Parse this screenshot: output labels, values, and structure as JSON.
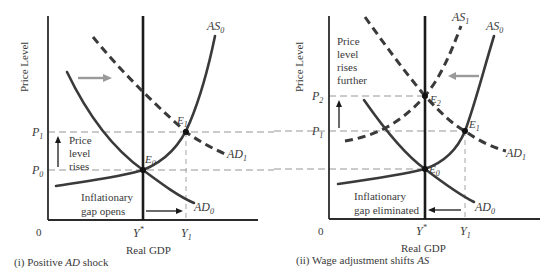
{
  "panels": [
    {
      "id": "i",
      "caption_prefix": "(i) Positive ",
      "caption_italic": "AD",
      "caption_suffix": " shock",
      "y_axis_label": "Price Level",
      "x_axis_label": "Real GDP",
      "origin_label": "0",
      "x_ticks": {
        "potential": "Y",
        "potential_sup": "*",
        "y1": "Y",
        "y1_sub": "1"
      },
      "y_ticks": [
        {
          "label": "P",
          "sub": "1"
        },
        {
          "label": "P",
          "sub": "0"
        }
      ],
      "curves": [
        {
          "label": "AS",
          "sub": "0",
          "style": "solid"
        },
        {
          "label": "AD",
          "sub": "0",
          "style": "solid"
        },
        {
          "label": "AD",
          "sub": "1",
          "style": "dashed"
        }
      ],
      "points": [
        {
          "label": "E",
          "sub": "0"
        },
        {
          "label": "E",
          "sub": "1"
        }
      ],
      "annotations": {
        "price_note": [
          "Price",
          "level",
          "rises"
        ],
        "gap_note": [
          "Inflationary",
          "gap opens"
        ]
      }
    },
    {
      "id": "ii",
      "caption_prefix": "(ii) Wage adjustment shifts ",
      "caption_italic": "AS",
      "caption_suffix": "",
      "y_axis_label": "Price Level",
      "x_axis_label": "Real GDP",
      "origin_label": "0",
      "x_ticks": {
        "potential": "Y",
        "potential_sup": "*",
        "y1": "Y",
        "y1_sub": "1"
      },
      "y_ticks": [
        {
          "label": "P",
          "sub": "2"
        },
        {
          "label": "P",
          "sub": "1"
        }
      ],
      "curves": [
        {
          "label": "AS",
          "sub": "0",
          "style": "solid"
        },
        {
          "label": "AS",
          "sub": "1",
          "style": "dashed"
        },
        {
          "label": "AD",
          "sub": "0",
          "style": "solid"
        },
        {
          "label": "AD",
          "sub": "1",
          "style": "dashed"
        }
      ],
      "points": [
        {
          "label": "E",
          "sub": "0"
        },
        {
          "label": "E",
          "sub": "1"
        },
        {
          "label": "E",
          "sub": "2"
        }
      ],
      "annotations": {
        "price_note": [
          "Price",
          "level",
          "rises",
          "further"
        ],
        "gap_note": [
          "Inflationary",
          "gap eliminated"
        ]
      }
    }
  ],
  "colors": {
    "curve": "#3a3a3a",
    "axis": "#2b2b2b",
    "shift_arrow": "#9a9a9a",
    "guide": "#8a8a8a"
  }
}
